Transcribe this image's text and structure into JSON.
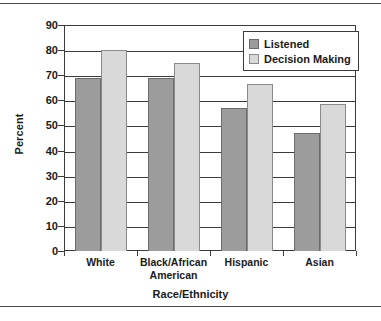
{
  "chart_data": {
    "type": "bar",
    "title": "",
    "xlabel": "Race/Ethnicity",
    "ylabel": "Percent",
    "categories": [
      "White",
      "Black/African American",
      "Hispanic",
      "Asian"
    ],
    "category_lines": [
      [
        "White"
      ],
      [
        "Black/African",
        "American"
      ],
      [
        "Hispanic"
      ],
      [
        "Asian"
      ]
    ],
    "series": [
      {
        "name": "Listened",
        "values": [
          69,
          69,
          57,
          47
        ],
        "color": "#9c9c9c"
      },
      {
        "name": "Decision Making",
        "values": [
          80,
          75,
          66.5,
          58.5
        ],
        "color": "#d9d9d9"
      }
    ],
    "ylim": [
      0,
      90
    ],
    "ytick_values": [
      90,
      80,
      70,
      60,
      50,
      40,
      30,
      20,
      10,
      0
    ],
    "ytick_labels": [
      "90",
      "80",
      "70",
      "60",
      "50",
      "40",
      "30",
      "20",
      "10",
      "0"
    ],
    "grid": true,
    "grid_axis": "y",
    "legend_position": "top-right"
  },
  "legend": {
    "entries": [
      {
        "label": "Listened",
        "swatch": "listened"
      },
      {
        "label": "Decision Making",
        "swatch": "decision"
      }
    ]
  }
}
